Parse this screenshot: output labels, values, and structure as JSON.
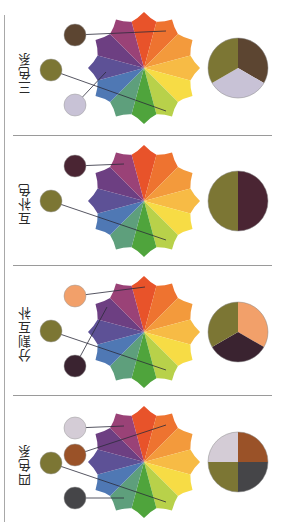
{
  "wheel": {
    "segments": [
      "#e8532a",
      "#ee7330",
      "#f39a3c",
      "#f7bb45",
      "#f7dc45",
      "#b8d14a",
      "#4fa43c",
      "#5e9f7c",
      "#4f78b4",
      "#5d5196",
      "#6d3f82",
      "#9a4277"
    ],
    "center_x": 144,
    "radius": 52
  },
  "panels": [
    {
      "label": "三色系",
      "top": 0,
      "wheel_cy": 68,
      "swatches": [
        {
          "name": "brown",
          "color": "#5c4531",
          "cx": 75,
          "cy": 35,
          "tx": 166,
          "ty": 31
        },
        {
          "name": "olive",
          "color": "#7c7634",
          "cx": 51,
          "cy": 70,
          "tx": 166,
          "ty": 111
        },
        {
          "name": "lavender",
          "color": "#c8c2d6",
          "cx": 75,
          "cy": 105,
          "tx": 106,
          "ty": 72
        }
      ],
      "pie": {
        "type": "thirds",
        "colors": [
          "#5c4531",
          "#c8c2d6",
          "#7c7634"
        ]
      }
    },
    {
      "label": "互补色",
      "top": 130,
      "wheel_cy": 201,
      "swatches": [
        {
          "name": "plum",
          "color": "#4a2533",
          "cx": 75,
          "cy": 166,
          "tx": 124,
          "ty": 164
        },
        {
          "name": "olive",
          "color": "#7c7634",
          "cx": 51,
          "cy": 201,
          "tx": 166,
          "ty": 240
        }
      ],
      "pie": {
        "type": "halves",
        "colors": [
          "#4a2533",
          "#7c7634"
        ]
      }
    },
    {
      "label": "分割互补",
      "top": 260,
      "wheel_cy": 332,
      "swatches": [
        {
          "name": "salmon",
          "color": "#f2a06a",
          "cx": 75,
          "cy": 296,
          "tx": 145,
          "ty": 287
        },
        {
          "name": "olive",
          "color": "#7c7634",
          "cx": 51,
          "cy": 331,
          "tx": 166,
          "ty": 370
        },
        {
          "name": "dark-plum",
          "color": "#3a2330",
          "cx": 75,
          "cy": 366,
          "tx": 107,
          "ty": 307
        }
      ],
      "pie": {
        "type": "thirds",
        "colors": [
          "#f2a06a",
          "#3a2330",
          "#7c7634"
        ]
      }
    },
    {
      "label": "四色系",
      "top": 390,
      "wheel_cy": 462,
      "swatches": [
        {
          "name": "lavender",
          "color": "#d4ccd6",
          "cx": 75,
          "cy": 428,
          "tx": 124,
          "ty": 426
        },
        {
          "name": "rust",
          "color": "#9a5228",
          "cx": 75,
          "cy": 455,
          "tx": 166,
          "ty": 425
        },
        {
          "name": "olive",
          "color": "#7c7634",
          "cx": 51,
          "cy": 463,
          "tx": 166,
          "ty": 502
        },
        {
          "name": "charcoal",
          "color": "#454548",
          "cx": 75,
          "cy": 498,
          "tx": 124,
          "ty": 498
        }
      ],
      "pie": {
        "type": "quarters",
        "colors": [
          "#9a5228",
          "#454548",
          "#7c7634",
          "#d4ccd6"
        ]
      }
    }
  ],
  "pie_center_x": 238,
  "pie_radius": 30,
  "swatch_radius": 11,
  "dividers_y": [
    135,
    265,
    395
  ]
}
